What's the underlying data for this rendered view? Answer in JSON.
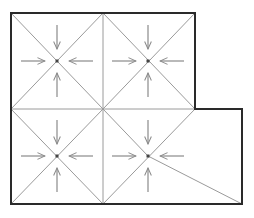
{
  "diagram": {
    "type": "grid-flow-diagram",
    "colors": {
      "outline": "#2a2a2a",
      "grid": "#9a9a9a",
      "arrow": "#8a8a8a",
      "node": "#444444"
    },
    "outline_points": [
      [
        11,
        13
      ],
      [
        195,
        13
      ],
      [
        195,
        109
      ],
      [
        242,
        109
      ],
      [
        242,
        204
      ],
      [
        11,
        204
      ]
    ],
    "grid_lines": [
      {
        "x1": 103,
        "y1": 13,
        "x2": 103,
        "y2": 204
      },
      {
        "x1": 11,
        "y1": 109,
        "x2": 195,
        "y2": 109
      },
      {
        "x1": 11,
        "y1": 13,
        "x2": 103,
        "y2": 109
      },
      {
        "x1": 103,
        "y1": 13,
        "x2": 11,
        "y2": 109
      },
      {
        "x1": 103,
        "y1": 13,
        "x2": 195,
        "y2": 109
      },
      {
        "x1": 195,
        "y1": 13,
        "x2": 103,
        "y2": 109
      },
      {
        "x1": 11,
        "y1": 109,
        "x2": 103,
        "y2": 204
      },
      {
        "x1": 103,
        "y1": 109,
        "x2": 11,
        "y2": 204
      },
      {
        "x1": 103,
        "y1": 109,
        "x2": 148,
        "y2": 156
      },
      {
        "x1": 195,
        "y1": 109,
        "x2": 103,
        "y2": 204
      },
      {
        "x1": 148,
        "y1": 156,
        "x2": 242,
        "y2": 204
      }
    ],
    "cells": [
      {
        "name": "cell-top-left",
        "cx": 57,
        "cy": 61
      },
      {
        "name": "cell-top-right",
        "cx": 148,
        "cy": 61
      },
      {
        "name": "cell-bottom-left",
        "cx": 57,
        "cy": 156
      },
      {
        "name": "cell-bottom-right",
        "cx": 148,
        "cy": 156
      }
    ],
    "arrow_offsets": {
      "near": 12,
      "far": 36
    }
  }
}
